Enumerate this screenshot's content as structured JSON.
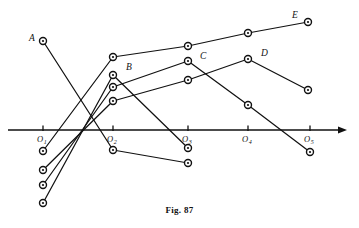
{
  "figure": {
    "caption": "Fig. 87",
    "axis": {
      "arrow": "right-arrow",
      "y": 130,
      "x_start": 8,
      "x_end": 347,
      "ticks": [
        {
          "label": "O",
          "sub": "1",
          "x": 43
        },
        {
          "label": "O",
          "sub": "2",
          "x": 113
        },
        {
          "label": "O",
          "sub": "3",
          "x": 188
        },
        {
          "label": "O",
          "sub": "4",
          "x": 248
        },
        {
          "label": "O",
          "sub": "5",
          "x": 310
        }
      ]
    },
    "vertex_labels": [
      {
        "name": "A",
        "x": 29,
        "y": 41
      },
      {
        "name": "B",
        "x": 126,
        "y": 70
      },
      {
        "name": "C",
        "x": 200,
        "y": 59
      },
      {
        "name": "D",
        "x": 261,
        "y": 56
      },
      {
        "name": "E",
        "x": 292,
        "y": 18
      }
    ],
    "polylines": [
      {
        "name": "A",
        "points": [
          [
            43,
            41
          ],
          [
            113,
            150
          ],
          [
            188,
            163
          ]
        ]
      },
      {
        "name": "B",
        "points": [
          [
            43,
            203
          ],
          [
            113,
            75
          ],
          [
            188,
            148
          ]
        ]
      },
      {
        "name": "C",
        "points": [
          [
            43,
            185
          ],
          [
            113,
            87
          ],
          [
            188,
            61
          ],
          [
            248,
            105
          ],
          [
            310,
            152
          ]
        ]
      },
      {
        "name": "D",
        "points": [
          [
            43,
            170
          ],
          [
            113,
            101
          ],
          [
            188,
            80
          ],
          [
            248,
            59
          ],
          [
            308,
            90
          ]
        ]
      },
      {
        "name": "E",
        "points": [
          [
            43,
            151
          ],
          [
            113,
            57
          ],
          [
            188,
            46
          ],
          [
            248,
            33
          ],
          [
            308,
            22
          ]
        ]
      }
    ],
    "nodes": [
      [
        43,
        41
      ],
      [
        43,
        151
      ],
      [
        43,
        170
      ],
      [
        43,
        185
      ],
      [
        43,
        203
      ],
      [
        113,
        57
      ],
      [
        113,
        75
      ],
      [
        113,
        87
      ],
      [
        113,
        101
      ],
      [
        113,
        150
      ],
      [
        188,
        46
      ],
      [
        188,
        61
      ],
      [
        188,
        80
      ],
      [
        188,
        148
      ],
      [
        188,
        163
      ],
      [
        248,
        33
      ],
      [
        248,
        59
      ],
      [
        248,
        105
      ],
      [
        308,
        22
      ],
      [
        308,
        90
      ],
      [
        310,
        152
      ]
    ]
  },
  "chart_data": {
    "type": "line",
    "title": "Fig. 87",
    "xlabel": "",
    "ylabel": "",
    "x": [
      "O1",
      "O2",
      "O3",
      "O4",
      "O5"
    ],
    "series": [
      {
        "name": "A",
        "values": [
          41,
          150,
          163,
          null,
          null
        ]
      },
      {
        "name": "B",
        "values": [
          203,
          75,
          148,
          null,
          null
        ]
      },
      {
        "name": "C",
        "values": [
          185,
          87,
          61,
          105,
          152
        ]
      },
      {
        "name": "D",
        "values": [
          170,
          101,
          80,
          59,
          90
        ]
      },
      {
        "name": "E",
        "values": [
          151,
          57,
          46,
          33,
          22
        ]
      }
    ],
    "legend_position": "inline-endpoint-labels",
    "grid": false
  }
}
